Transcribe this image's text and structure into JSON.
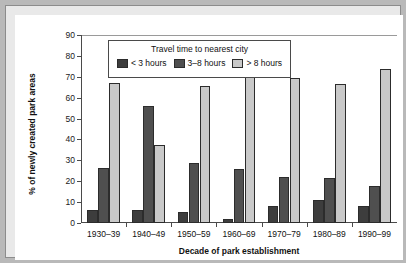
{
  "chart_data": {
    "type": "bar",
    "title": "",
    "subtitle": "",
    "xlabel": "Decade of park establishment",
    "ylabel": "% of newly created park areas",
    "categories": [
      "1930–39",
      "1940–49",
      "1950–59",
      "1960–69",
      "1970–79",
      "1980–89",
      "1990–99"
    ],
    "series": [
      {
        "name": "< 3 hours",
        "color": "#3d3d3d",
        "values": [
          6,
          6,
          5.3,
          2,
          8,
          11,
          8
        ]
      },
      {
        "name": "3–8 hours",
        "color": "#4f4f4f",
        "values": [
          26.5,
          56,
          28.5,
          26,
          22,
          21.5,
          17.5
        ]
      },
      {
        "name": "> 8 hours",
        "color": "#c9c9c9",
        "values": [
          67,
          37.5,
          65.5,
          71,
          69.3,
          66.5,
          73.5
        ]
      }
    ],
    "ylim": [
      0,
      90
    ],
    "ytick_step": 10,
    "yticks": [
      0,
      10,
      20,
      30,
      40,
      50,
      60,
      70,
      80,
      90
    ],
    "grid": false,
    "legend_position": "top-center",
    "legend_title": "Travel time to nearest city",
    "bar_edge_color": "#2c2c2c",
    "axis_color": "#4a4a4a",
    "plot_background": "#ffffff",
    "frame_background": "#e9e9e9"
  },
  "figure": {
    "legend": {
      "title": "Travel time to nearest city"
    }
  }
}
